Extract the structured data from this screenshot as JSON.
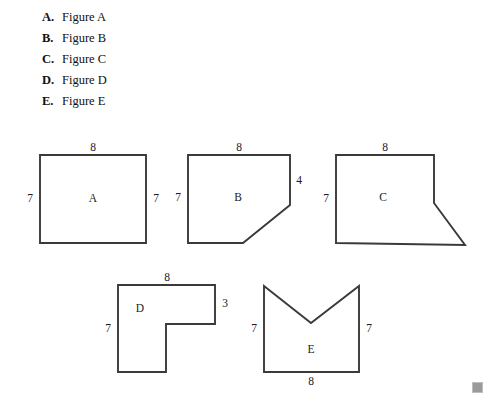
{
  "choices": [
    {
      "letter": "A.",
      "label": "Figure A"
    },
    {
      "letter": "B.",
      "label": "Figure B"
    },
    {
      "letter": "C.",
      "label": "Figure C"
    },
    {
      "letter": "D.",
      "label": "Figure D"
    },
    {
      "letter": "E.",
      "label": "Figure E"
    }
  ],
  "figures": {
    "a": {
      "name": "A",
      "shape": "rectangle",
      "dims": {
        "top": "8",
        "left": "7",
        "right": "7"
      }
    },
    "b": {
      "name": "B",
      "shape": "rectangle-with-cut-corner",
      "dims": {
        "top": "8",
        "left": "7",
        "right": "4"
      }
    },
    "c": {
      "name": "C",
      "shape": "rectangle-with-triangular-spike",
      "dims": {
        "top": "8",
        "left": "7"
      }
    },
    "d": {
      "name": "D",
      "shape": "l-shape",
      "dims": {
        "top": "8",
        "left": "7",
        "right": "3"
      }
    },
    "e": {
      "name": "E",
      "shape": "square-with-v-notch",
      "dims": {
        "bottom": "8",
        "left": "7",
        "right": "7"
      }
    }
  },
  "colors": {
    "stroke": "#3a3a3a",
    "text": "#1a1a1a",
    "background": "#ffffff",
    "marker": "#9a9a9a"
  }
}
